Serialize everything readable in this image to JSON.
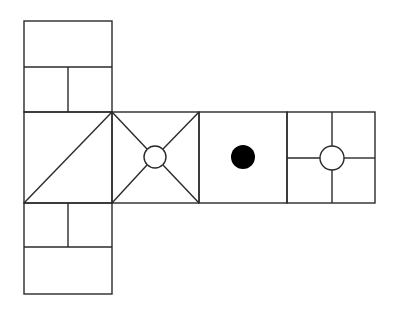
{
  "diagram": {
    "type": "cube-net",
    "colors": {
      "stroke": "#2a2a2a",
      "background": "#ffffff",
      "dot": "#000000"
    },
    "faces": [
      {
        "id": "top",
        "pattern": "rectangle-over-two-squares",
        "x": 24,
        "y": 21,
        "w": 88,
        "h": 91
      },
      {
        "id": "left",
        "pattern": "single-diagonal",
        "x": 24,
        "y": 112,
        "w": 88,
        "h": 91
      },
      {
        "id": "center",
        "pattern": "x-with-open-circle",
        "x": 112,
        "y": 112,
        "w": 87,
        "h": 91
      },
      {
        "id": "right",
        "pattern": "filled-dot",
        "x": 199,
        "y": 112,
        "w": 88,
        "h": 91
      },
      {
        "id": "far-right",
        "pattern": "cross-with-open-circle",
        "x": 287,
        "y": 112,
        "w": 88,
        "h": 91
      },
      {
        "id": "bottom",
        "pattern": "two-squares-over-rectangle",
        "x": 24,
        "y": 203,
        "w": 88,
        "h": 91
      }
    ],
    "symbols": [
      {
        "face": "center",
        "kind": "open-circle",
        "cx": 155,
        "cy": 157,
        "r": 11
      },
      {
        "face": "right",
        "kind": "filled-circle",
        "cx": 243,
        "cy": 157,
        "r": 12
      },
      {
        "face": "far-right",
        "kind": "open-circle",
        "cx": 332,
        "cy": 158,
        "r": 12
      }
    ]
  }
}
